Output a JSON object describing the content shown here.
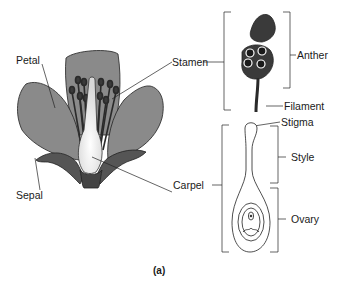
{
  "diagram": {
    "caption": "(a)",
    "labels": {
      "petal": "Petal",
      "stamen": "Stamen",
      "sepal": "Sepal",
      "carpel": "Carpel",
      "anther": "Anther",
      "filament": "Filament",
      "stigma": "Stigma",
      "style": "Style",
      "ovary": "Ovary"
    },
    "colors": {
      "petal_fill": "#8a8a8a",
      "sepal_fill": "#555555",
      "stamen_fill": "#3a3a3a",
      "carpel_fill": "#f2f2f2",
      "line": "#222222"
    }
  }
}
